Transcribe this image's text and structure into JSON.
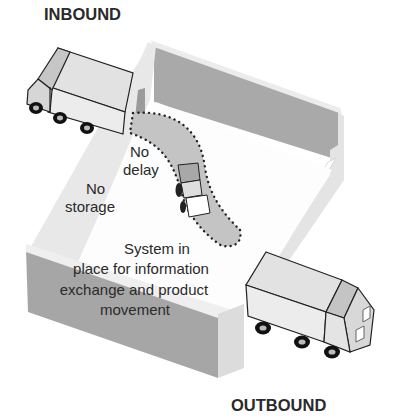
{
  "diagram": {
    "title_inbound": "INBOUND",
    "title_outbound": "OUTBOUND",
    "labels": {
      "no_delay": [
        "No",
        "delay"
      ],
      "no_storage": [
        "No",
        "storage"
      ],
      "system": [
        "System in",
        "place for information",
        "exchange and product",
        "movement"
      ]
    },
    "colors": {
      "wall_dark": "#a9a9a9",
      "wall_light": "#e6e6e6",
      "floor": "#ffffff",
      "path_fill": "#c4c4c4",
      "truck_body": "#e9e9e9",
      "truck_cab": "#bdbdbd",
      "text": "#2a2a2a"
    }
  }
}
